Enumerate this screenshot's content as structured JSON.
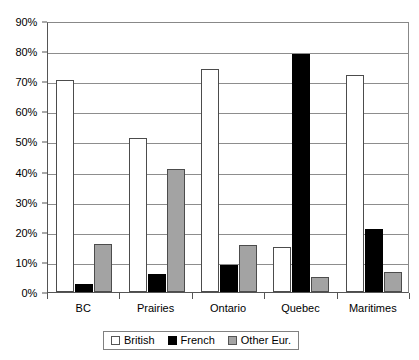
{
  "chart_data": {
    "type": "bar",
    "title": "",
    "subtitle": "",
    "xlabel": "",
    "ylabel": "",
    "categories": [
      "BC",
      "Prairies",
      "Ontario",
      "Quebec",
      "Maritimes"
    ],
    "series": [
      {
        "name": "British",
        "color": "#ffffff",
        "values": [
          70.5,
          51,
          74,
          15,
          72
        ]
      },
      {
        "name": "French",
        "color": "#000000",
        "values": [
          2.5,
          6,
          9,
          79,
          21
        ]
      },
      {
        "name": "Other Eur.",
        "color": "#a3a3a3",
        "values": [
          16,
          41,
          15.5,
          5,
          6.5
        ]
      }
    ],
    "ylim": [
      0,
      90
    ],
    "ytick_step": 10,
    "ytick_labels": [
      "0%",
      "10%",
      "20%",
      "30%",
      "40%",
      "50%",
      "60%",
      "70%",
      "80%",
      "90%"
    ],
    "ytick_values": [
      0,
      10,
      20,
      30,
      40,
      50,
      60,
      70,
      80,
      90
    ],
    "grid": true,
    "legend_position": "bottom",
    "legend_entries": [
      "British",
      "French",
      "Other Eur."
    ]
  }
}
